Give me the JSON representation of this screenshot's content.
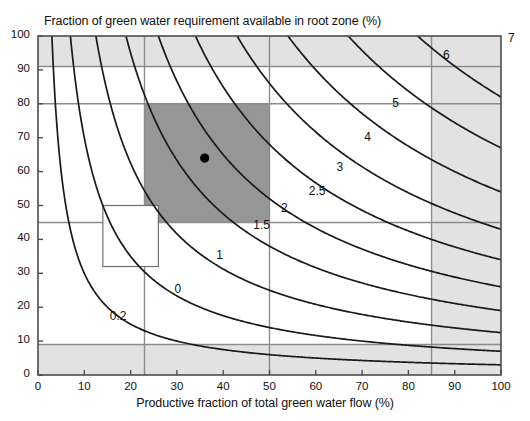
{
  "chart_data": {
    "type": "line",
    "title": "Fraction of green water requirement available in root zone (%)",
    "xlabel": "Productive fraction of total green water flow (%)",
    "ylabel": "Fraction of green water requirement available in root zone (%)",
    "xlim": [
      0,
      100
    ],
    "ylim": [
      0,
      100
    ],
    "xticks": [
      "0",
      "10",
      "20",
      "30",
      "40",
      "50",
      "60",
      "70",
      "80",
      "90",
      "100"
    ],
    "yticks": [
      "0",
      "10",
      "20",
      "30",
      "40",
      "50",
      "60",
      "70",
      "80",
      "90",
      "100"
    ],
    "grid": true,
    "legend": "none",
    "contour_labels": [
      "0.2",
      "0",
      "1",
      "1.5",
      "2",
      "2.5",
      "3",
      "4",
      "5",
      "6",
      "7"
    ],
    "contours": [
      {
        "label": "0.2",
        "k": 300,
        "label_x": 17,
        "label_y": 17
      },
      {
        "label": "0",
        "k": 700,
        "label_x": 31,
        "label_y": 25
      },
      {
        "label": "1",
        "k": 1250,
        "label_x": 40,
        "label_y": 35
      },
      {
        "label": "1.5",
        "k": 1900,
        "label_x": 48,
        "label_y": 44
      },
      {
        "label": "2",
        "k": 2600,
        "label_x": 54,
        "label_y": 49
      },
      {
        "label": "2.5",
        "k": 3400,
        "label_x": 60,
        "label_y": 54
      },
      {
        "label": "3",
        "k": 4300,
        "label_x": 66,
        "label_y": 61
      },
      {
        "label": "4",
        "k": 5400,
        "label_x": 72,
        "label_y": 70
      },
      {
        "label": "5",
        "k": 6700,
        "label_x": 78,
        "label_y": 80
      },
      {
        "label": "6",
        "k": 8200,
        "label_x": 89,
        "label_y": 94
      },
      {
        "label": "7",
        "k": 10000,
        "label_x": 103,
        "label_y": 99
      }
    ],
    "gridlines_x": [
      23,
      50,
      85
    ],
    "gridlines_y": [
      9,
      45,
      80,
      91
    ],
    "shaded_bands": [
      {
        "name": "top-band",
        "y_from": 91,
        "y_to": 100,
        "color": "#e2e2e2"
      },
      {
        "name": "bottom-band",
        "y_from": 0,
        "y_to": 9,
        "color": "#e2e2e2"
      },
      {
        "name": "right-band",
        "x_from": 85,
        "x_to": 100,
        "color": "#e2e2e2"
      }
    ],
    "highlight_rect": {
      "name": "dark-region",
      "x_from": 23,
      "x_to": 50,
      "y_from": 45,
      "y_to": 80,
      "color": "#969696"
    },
    "outline_rect": {
      "name": "light-region",
      "x_from": 14,
      "x_to": 26,
      "y_from": 32,
      "y_to": 50,
      "color": "#ffffff"
    },
    "marker_point": {
      "x": 36,
      "y": 64,
      "color": "#000000"
    }
  },
  "colors": {
    "axis": "#4d4d4d",
    "grid": "#8c8c8c",
    "contour": "#1a1a1a",
    "shade_light": "#e2e2e2",
    "shade_dark": "#969696",
    "marker": "#000000",
    "background": "#ffffff"
  }
}
